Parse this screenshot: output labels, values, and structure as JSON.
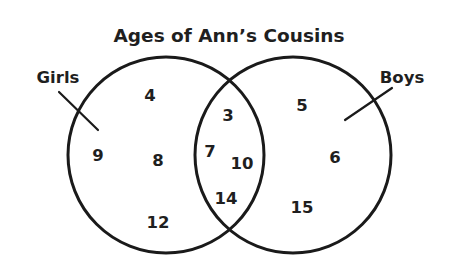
{
  "diagram": {
    "type": "venn",
    "title": "Ages of Ann’s Cousins",
    "sets": [
      {
        "id": "girls",
        "label": "Girls"
      },
      {
        "id": "boys",
        "label": "Boys"
      }
    ],
    "regions": {
      "girls_only": [
        "4",
        "9",
        "8",
        "12"
      ],
      "both": [
        "3",
        "7",
        "10",
        "14"
      ],
      "boys_only": [
        "5",
        "6",
        "15"
      ]
    },
    "colors": {
      "stroke": "#1a1a1a",
      "text": "#1f1f1f",
      "background": "#ffffff"
    }
  }
}
